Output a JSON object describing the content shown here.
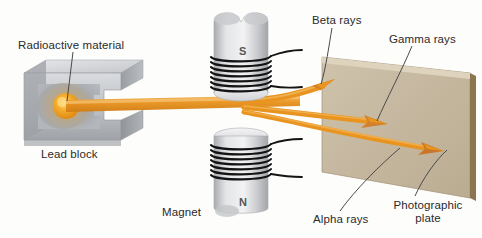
{
  "figure": {
    "background_color": "#fdfdfc"
  },
  "labels": {
    "radioactive_material": "Radioactive material",
    "lead_block": "Lead block",
    "magnet": "Magnet",
    "beta_rays": "Beta rays",
    "gamma_rays": "Gamma rays",
    "alpha_rays": "Alpha rays",
    "photographic_plate_line1": "Photographic",
    "photographic_plate_line2": "plate"
  },
  "magnet_poles": {
    "top": "S",
    "bottom": "N"
  },
  "colors": {
    "ray_orange": "#e8941f",
    "ray_orange_light": "#f0ad4a",
    "ray_orange_dark": "#c9762a",
    "plate_face": "#c2b49a",
    "plate_edge": "#8d7550",
    "lead_gray": "#b9bcc0",
    "lead_gray_dark": "#8e9196",
    "magnet_body": "#d6d7d9",
    "coil_wire": "#1a1a1a",
    "label_text": "#2b2b2b",
    "leader_line": "#4a4a4a",
    "source_glow": "#f5a623"
  },
  "rays": [
    {
      "name": "beta",
      "deflection": "upward",
      "label": "Beta rays"
    },
    {
      "name": "gamma",
      "deflection": "straight",
      "label": "Gamma rays"
    },
    {
      "name": "alpha",
      "deflection": "downward",
      "label": "Alpha rays"
    }
  ],
  "components": [
    {
      "name": "lead-block",
      "label": "Lead block"
    },
    {
      "name": "radioactive-source",
      "label": "Radioactive material"
    },
    {
      "name": "magnet-top",
      "label": "Magnet",
      "pole": "S"
    },
    {
      "name": "magnet-bottom",
      "label": "Magnet",
      "pole": "N"
    },
    {
      "name": "photographic-plate",
      "label": "Photographic plate"
    }
  ]
}
